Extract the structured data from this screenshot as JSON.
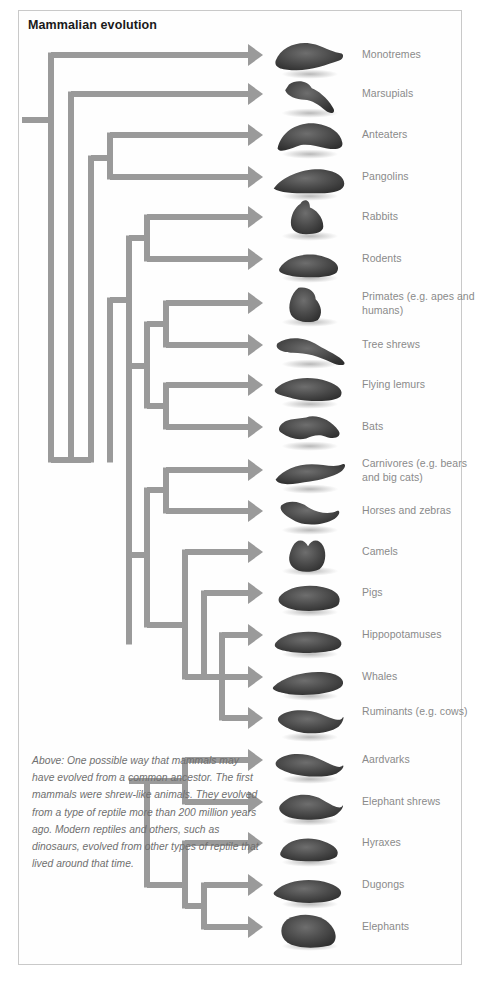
{
  "figure": {
    "title": "Mammalian evolution",
    "caption": "Above: One possible way that mammals may have evolved from a common ancestor. The first mammals were shrew-like animals. They evolved from a type of reptile more than 200 million years ago. Modern reptiles and others, such as dinosaurs, evolved from other types of reptile that lived around that time.",
    "colors": {
      "branch": "#9a9a9a",
      "label_text": "#8a8a8a",
      "title_text": "#1a1a1a",
      "caption_text": "#6f6f6f",
      "frame_border": "#c9c9c9",
      "background": "#ffffff"
    }
  },
  "chart_data": {
    "type": "diagram",
    "title": "Mammalian evolution",
    "taxa": [
      {
        "label": "Monotremes",
        "y": 55,
        "animal": "platypus"
      },
      {
        "label": "Marsupials",
        "y": 94,
        "animal": "kangaroo"
      },
      {
        "label": "Anteaters",
        "y": 135,
        "animal": "anteater"
      },
      {
        "label": "Pangolins",
        "y": 177,
        "animal": "pangolin"
      },
      {
        "label": "Rabbits",
        "y": 217,
        "animal": "rabbit"
      },
      {
        "label": "Rodents",
        "y": 259,
        "animal": "rodent"
      },
      {
        "label": "Primates (e.g. apes and humans)",
        "y": 303,
        "animal": "gorilla"
      },
      {
        "label": "Tree shrews",
        "y": 345,
        "animal": "tree-shrew"
      },
      {
        "label": "Flying lemurs",
        "y": 385,
        "animal": "flying-lemur"
      },
      {
        "label": "Bats",
        "y": 427,
        "animal": "bat"
      },
      {
        "label": "Carnivores (e.g. bears and big cats)",
        "y": 470,
        "animal": "cheetah"
      },
      {
        "label": "Horses and zebras",
        "y": 511,
        "animal": "horse"
      },
      {
        "label": "Camels",
        "y": 552,
        "animal": "camel"
      },
      {
        "label": "Pigs",
        "y": 593,
        "animal": "pig"
      },
      {
        "label": "Hippopotamuses",
        "y": 635,
        "animal": "hippo"
      },
      {
        "label": "Whales",
        "y": 677,
        "animal": "whale"
      },
      {
        "label": "Ruminants (e.g. cows)",
        "y": 718,
        "animal": "cow"
      },
      {
        "label": "Aardvarks",
        "y": 760,
        "animal": "aardvark"
      },
      {
        "label": "Elephant shrews",
        "y": 802,
        "animal": "elephant-shrew"
      },
      {
        "label": "Hyraxes",
        "y": 843,
        "animal": "hyrax"
      },
      {
        "label": "Dugongs",
        "y": 885,
        "animal": "dugong"
      },
      {
        "label": "Elephants",
        "y": 927,
        "animal": "elephant"
      }
    ]
  },
  "labels": [
    {
      "text": "Monotremes",
      "top": 48
    },
    {
      "text": "Marsupials",
      "top": 87
    },
    {
      "text": "Anteaters",
      "top": 128
    },
    {
      "text": "Pangolins",
      "top": 170
    },
    {
      "text": "Rabbits",
      "top": 210
    },
    {
      "text": "Rodents",
      "top": 252
    },
    {
      "text": "Primates (e.g. apes and humans)",
      "top": 290
    },
    {
      "text": "Tree shrews",
      "top": 338
    },
    {
      "text": "Flying lemurs",
      "top": 378
    },
    {
      "text": "Bats",
      "top": 420
    },
    {
      "text": "Carnivores (e.g. bears and big cats)",
      "top": 457
    },
    {
      "text": "Horses and zebras",
      "top": 504
    },
    {
      "text": "Camels",
      "top": 545
    },
    {
      "text": "Pigs",
      "top": 586
    },
    {
      "text": "Hippopotamuses",
      "top": 628
    },
    {
      "text": "Whales",
      "top": 670
    },
    {
      "text": "Ruminants (e.g. cows)",
      "top": 705
    },
    {
      "text": "Aardvarks",
      "top": 753
    },
    {
      "text": "Elephant shrews",
      "top": 795
    },
    {
      "text": "Hyraxes",
      "top": 836
    },
    {
      "text": "Dugongs",
      "top": 878
    },
    {
      "text": "Elephants",
      "top": 920
    }
  ]
}
